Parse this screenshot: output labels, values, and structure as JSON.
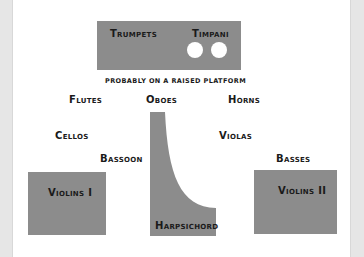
{
  "diagram": {
    "type": "orchestra seating plan",
    "colors": {
      "section_fill": "#8c8c8c",
      "background": "#ffffff",
      "text": "#1a1a1a",
      "side_strip": "#e6e6e6"
    },
    "platform": {
      "trumpets": "Trumpets",
      "timpani": "Timpani",
      "caption": "Probably on a raised platform"
    },
    "sections": {
      "flutes": "Flutes",
      "oboes": "Oboes",
      "horns": "Horns",
      "cellos": "Cellos",
      "violas": "Violas",
      "bassoon": "Bassoon",
      "basses": "Basses",
      "violins_1": "Violins I",
      "violins_2": "Violins II",
      "harpsichord": "Harpsichord"
    }
  }
}
